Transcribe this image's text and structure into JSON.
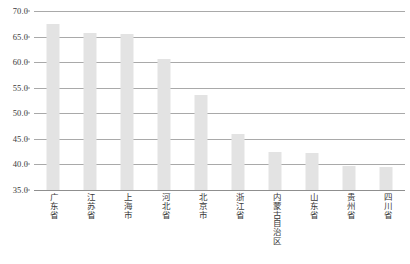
{
  "chart_data": {
    "type": "bar",
    "title": "",
    "xlabel": "",
    "ylabel": "",
    "ylim": [
      35.0,
      70.0
    ],
    "ytick_step": 5.0,
    "yticks": [
      "70.0",
      "65.0",
      "60.0",
      "55.0",
      "50.0",
      "45.0",
      "40.0",
      "35.0"
    ],
    "grid": true,
    "legend": false,
    "bar_color": "#e3e3e3",
    "gridline_color": "#a9a9a9",
    "categories": [
      "广东省",
      "江苏省",
      "上海市",
      "河北省",
      "北京市",
      "浙江省",
      "内蒙古自治区",
      "山东省",
      "贵州省",
      "四川省"
    ],
    "values": [
      67.5,
      65.7,
      65.6,
      60.7,
      53.6,
      46.0,
      42.4,
      42.2,
      39.7,
      39.5
    ]
  }
}
